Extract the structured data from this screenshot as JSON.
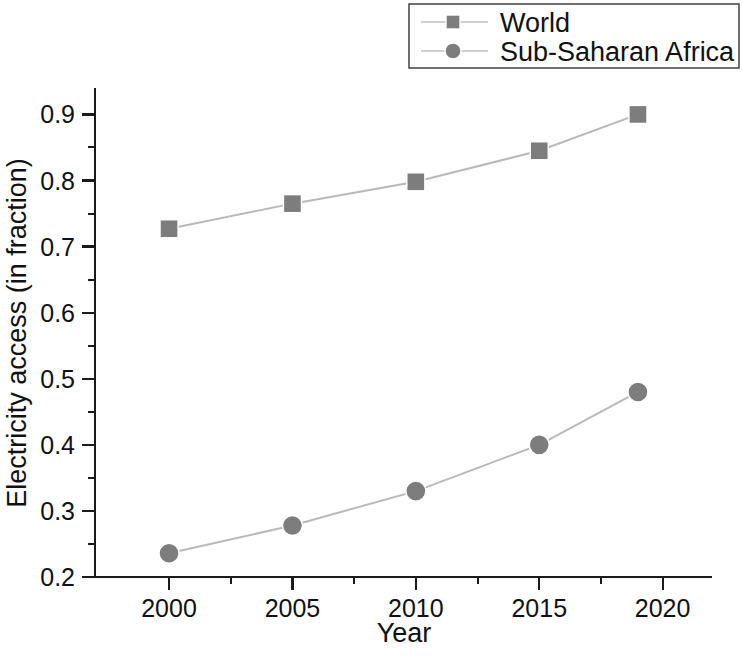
{
  "chart_data": {
    "type": "line",
    "title": "",
    "xlabel": "Year",
    "ylabel": "Electricity access (in fraction)",
    "x": [
      2000,
      2005,
      2010,
      2015,
      2019
    ],
    "xlim": [
      1997,
      2022
    ],
    "ylim": [
      0.2,
      0.94
    ],
    "grid": false,
    "legend_position": "top-right",
    "x_ticks": [
      2000,
      2005,
      2010,
      2015,
      2020
    ],
    "x_tick_labels": [
      "2000",
      "2005",
      "2010",
      "2015",
      "2020"
    ],
    "x_minor_interval": 2.5,
    "y_ticks": [
      0.2,
      0.3,
      0.4,
      0.5,
      0.6,
      0.7,
      0.8,
      0.9
    ],
    "y_tick_labels": [
      "0.2",
      "0.3",
      "0.4",
      "0.5",
      "0.6",
      "0.7",
      "0.8",
      "0.9"
    ],
    "y_minor_interval": 0.05,
    "series": [
      {
        "name": "World",
        "marker": "square",
        "color": "#7d7d7d",
        "line_color": "#b9b9b9",
        "values": [
          0.727,
          0.765,
          0.798,
          0.845,
          0.9
        ]
      },
      {
        "name": "Sub-Saharan Africa",
        "marker": "circle",
        "color": "#7d7d7d",
        "line_color": "#b9b9b9",
        "values": [
          0.236,
          0.278,
          0.33,
          0.4,
          0.48
        ]
      }
    ]
  },
  "legend": {
    "entries": [
      {
        "label": "World"
      },
      {
        "label": "Sub-Saharan Africa"
      }
    ]
  },
  "axes": {
    "x_title": "Year",
    "y_title": "Electricity access (in fraction)"
  }
}
